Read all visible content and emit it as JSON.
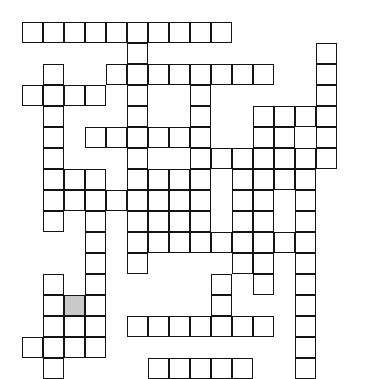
{
  "puzzle": {
    "title": "Crossword Grid",
    "type": "crossword-grid",
    "description": "Blank interlocking crossword puzzle grid with one shaded highlighted cell",
    "grid": {
      "columns": 16,
      "rows": 17,
      "cell_size_px": 21,
      "origin_x_px": 22,
      "origin_y_px": 22,
      "line_color": "#141414",
      "cell_fill_color": "#ffffff",
      "shaded_fill_color": "#c9c9c9",
      "background_color": "#ffffff",
      "border_width_px": 1.6
    },
    "shaded_cells": [
      {
        "row": 13,
        "col": 2
      }
    ],
    "cells": [
      {
        "row": 0,
        "col": 0
      },
      {
        "row": 0,
        "col": 1
      },
      {
        "row": 0,
        "col": 2
      },
      {
        "row": 0,
        "col": 3
      },
      {
        "row": 0,
        "col": 4
      },
      {
        "row": 0,
        "col": 5
      },
      {
        "row": 0,
        "col": 6
      },
      {
        "row": 0,
        "col": 7
      },
      {
        "row": 0,
        "col": 8
      },
      {
        "row": 0,
        "col": 9
      },
      {
        "row": 1,
        "col": 5
      },
      {
        "row": 1,
        "col": 14
      },
      {
        "row": 2,
        "col": 1
      },
      {
        "row": 2,
        "col": 4
      },
      {
        "row": 2,
        "col": 5
      },
      {
        "row": 2,
        "col": 6
      },
      {
        "row": 2,
        "col": 7
      },
      {
        "row": 2,
        "col": 8
      },
      {
        "row": 2,
        "col": 9
      },
      {
        "row": 2,
        "col": 10
      },
      {
        "row": 2,
        "col": 11
      },
      {
        "row": 2,
        "col": 14
      },
      {
        "row": 3,
        "col": 0
      },
      {
        "row": 3,
        "col": 1
      },
      {
        "row": 3,
        "col": 2
      },
      {
        "row": 3,
        "col": 3
      },
      {
        "row": 3,
        "col": 5
      },
      {
        "row": 3,
        "col": 8
      },
      {
        "row": 3,
        "col": 14
      },
      {
        "row": 4,
        "col": 1
      },
      {
        "row": 4,
        "col": 5
      },
      {
        "row": 4,
        "col": 8
      },
      {
        "row": 4,
        "col": 11
      },
      {
        "row": 4,
        "col": 12
      },
      {
        "row": 4,
        "col": 13
      },
      {
        "row": 4,
        "col": 14
      },
      {
        "row": 5,
        "col": 1
      },
      {
        "row": 5,
        "col": 3
      },
      {
        "row": 5,
        "col": 4
      },
      {
        "row": 5,
        "col": 5
      },
      {
        "row": 5,
        "col": 6
      },
      {
        "row": 5,
        "col": 7
      },
      {
        "row": 5,
        "col": 8
      },
      {
        "row": 5,
        "col": 11
      },
      {
        "row": 5,
        "col": 12
      },
      {
        "row": 5,
        "col": 14
      },
      {
        "row": 6,
        "col": 1
      },
      {
        "row": 6,
        "col": 5
      },
      {
        "row": 6,
        "col": 8
      },
      {
        "row": 6,
        "col": 9
      },
      {
        "row": 6,
        "col": 10
      },
      {
        "row": 6,
        "col": 11
      },
      {
        "row": 6,
        "col": 12
      },
      {
        "row": 6,
        "col": 13
      },
      {
        "row": 6,
        "col": 14
      },
      {
        "row": 7,
        "col": 1
      },
      {
        "row": 7,
        "col": 2
      },
      {
        "row": 7,
        "col": 3
      },
      {
        "row": 7,
        "col": 5
      },
      {
        "row": 7,
        "col": 6
      },
      {
        "row": 7,
        "col": 7
      },
      {
        "row": 7,
        "col": 8
      },
      {
        "row": 7,
        "col": 10
      },
      {
        "row": 7,
        "col": 11
      },
      {
        "row": 7,
        "col": 12
      },
      {
        "row": 7,
        "col": 13
      },
      {
        "row": 8,
        "col": 1
      },
      {
        "row": 8,
        "col": 2
      },
      {
        "row": 8,
        "col": 3
      },
      {
        "row": 8,
        "col": 4
      },
      {
        "row": 8,
        "col": 5
      },
      {
        "row": 8,
        "col": 6
      },
      {
        "row": 8,
        "col": 7
      },
      {
        "row": 8,
        "col": 8
      },
      {
        "row": 8,
        "col": 10
      },
      {
        "row": 8,
        "col": 11
      },
      {
        "row": 8,
        "col": 13
      },
      {
        "row": 9,
        "col": 1
      },
      {
        "row": 9,
        "col": 3
      },
      {
        "row": 9,
        "col": 5
      },
      {
        "row": 9,
        "col": 6
      },
      {
        "row": 9,
        "col": 7
      },
      {
        "row": 9,
        "col": 8
      },
      {
        "row": 9,
        "col": 10
      },
      {
        "row": 9,
        "col": 11
      },
      {
        "row": 9,
        "col": 13
      },
      {
        "row": 10,
        "col": 3
      },
      {
        "row": 10,
        "col": 5
      },
      {
        "row": 10,
        "col": 6
      },
      {
        "row": 10,
        "col": 7
      },
      {
        "row": 10,
        "col": 8
      },
      {
        "row": 10,
        "col": 9
      },
      {
        "row": 10,
        "col": 10
      },
      {
        "row": 10,
        "col": 11
      },
      {
        "row": 10,
        "col": 12
      },
      {
        "row": 10,
        "col": 13
      },
      {
        "row": 11,
        "col": 3
      },
      {
        "row": 11,
        "col": 5
      },
      {
        "row": 11,
        "col": 10
      },
      {
        "row": 11,
        "col": 11
      },
      {
        "row": 11,
        "col": 13
      },
      {
        "row": 12,
        "col": 1
      },
      {
        "row": 12,
        "col": 3
      },
      {
        "row": 12,
        "col": 9
      },
      {
        "row": 12,
        "col": 11
      },
      {
        "row": 12,
        "col": 13
      },
      {
        "row": 13,
        "col": 1
      },
      {
        "row": 13,
        "col": 2
      },
      {
        "row": 13,
        "col": 3
      },
      {
        "row": 13,
        "col": 9
      },
      {
        "row": 13,
        "col": 13
      },
      {
        "row": 14,
        "col": 1
      },
      {
        "row": 14,
        "col": 2
      },
      {
        "row": 14,
        "col": 3
      },
      {
        "row": 14,
        "col": 5
      },
      {
        "row": 14,
        "col": 6
      },
      {
        "row": 14,
        "col": 7
      },
      {
        "row": 14,
        "col": 8
      },
      {
        "row": 14,
        "col": 9
      },
      {
        "row": 14,
        "col": 10
      },
      {
        "row": 14,
        "col": 11
      },
      {
        "row": 14,
        "col": 13
      },
      {
        "row": 15,
        "col": 0
      },
      {
        "row": 15,
        "col": 1
      },
      {
        "row": 15,
        "col": 2
      },
      {
        "row": 15,
        "col": 3
      },
      {
        "row": 15,
        "col": 13
      },
      {
        "row": 16,
        "col": 1
      },
      {
        "row": 16,
        "col": 6
      },
      {
        "row": 16,
        "col": 7
      },
      {
        "row": 16,
        "col": 8
      },
      {
        "row": 16,
        "col": 9
      },
      {
        "row": 16,
        "col": 10
      },
      {
        "row": 16,
        "col": 13
      }
    ]
  }
}
